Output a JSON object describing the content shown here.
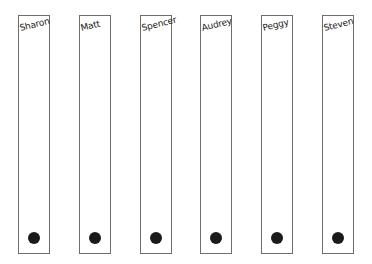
{
  "lanes": [
    {
      "name": "Sharon",
      "left": 18
    },
    {
      "name": "Matt",
      "left": 79
    },
    {
      "name": "Spencer",
      "left": 140
    },
    {
      "name": "Audrey",
      "left": 200
    },
    {
      "name": "Peggy",
      "left": 261
    },
    {
      "name": "Steven",
      "left": 322
    }
  ],
  "colors": {
    "border": "#6e6e6e",
    "dot": "#1a1a1a"
  }
}
